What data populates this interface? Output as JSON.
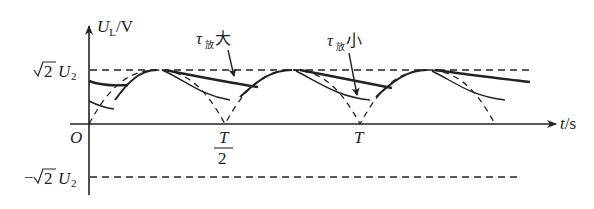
{
  "diagram": {
    "type": "waveform",
    "y_axis": {
      "label_main": "U",
      "label_sub": "L",
      "label_unit": "/V"
    },
    "x_axis": {
      "label_main": "t",
      "label_unit": "/s"
    },
    "origin_label": "O",
    "y_levels": {
      "positive": {
        "prefix": "",
        "radical": "2",
        "var": "U",
        "sub": "2"
      },
      "negative": {
        "prefix": "−",
        "radical": "2",
        "var": "U",
        "sub": "2"
      }
    },
    "x_ticks": [
      {
        "label": "T",
        "denominator": "2",
        "position": "T/2"
      },
      {
        "label": "T",
        "position": "T"
      }
    ],
    "annotations": [
      {
        "tau": "τ",
        "sub": "放",
        "word": "大",
        "meaning": "large discharge time constant"
      },
      {
        "tau": "τ",
        "sub": "放",
        "word": "小",
        "meaning": "small discharge time constant"
      }
    ],
    "colors": {
      "line": "#222222",
      "background": "#ffffff"
    }
  }
}
